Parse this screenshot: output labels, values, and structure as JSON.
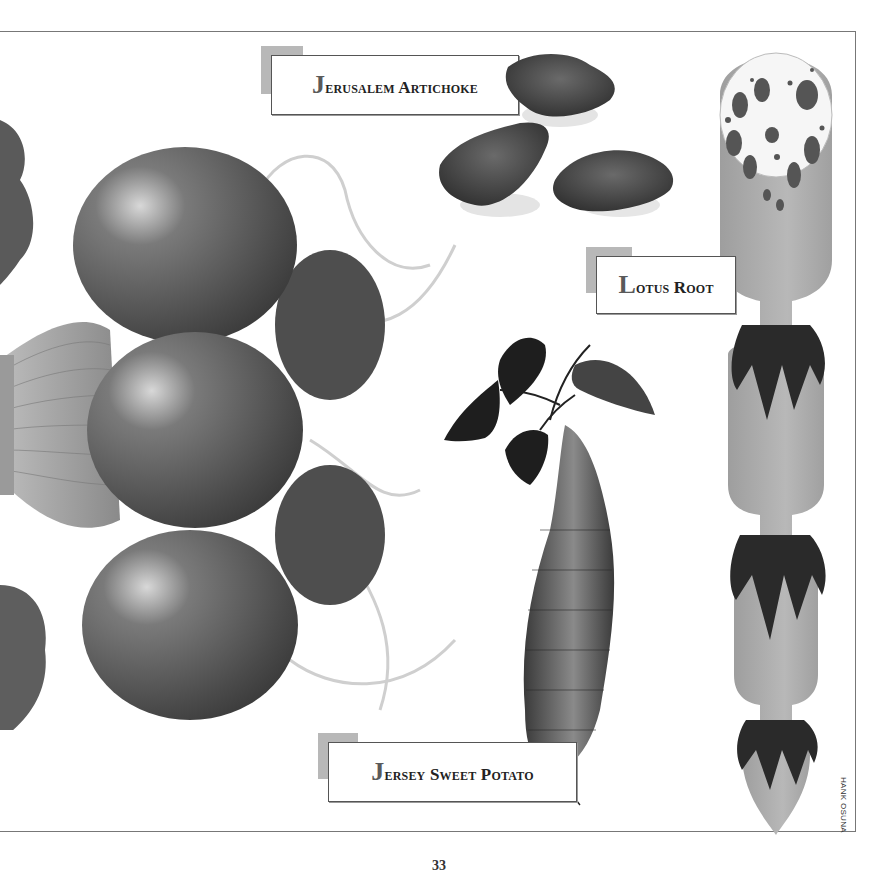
{
  "page": {
    "labels": {
      "jerusalem_artichoke": "Jerusalem Artichoke",
      "lotus_root": "Lotus Root",
      "jersey_sweet_potato": "Jersey Sweet Potato"
    },
    "artist_credit": "HANK OSUNA",
    "page_number": "33"
  },
  "illustrations": [
    {
      "id": "radishes",
      "icon": "radish-bunch-illustration"
    },
    {
      "id": "artichokes",
      "icon": "jerusalem-artichoke-tubers"
    },
    {
      "id": "sweet_potato",
      "icon": "sweet-potato-with-leaves"
    },
    {
      "id": "lotus_root",
      "icon": "lotus-root-segments"
    }
  ],
  "colors": {
    "label_tab": "#b8b8b8",
    "label_border": "#555555",
    "ink": "#222222",
    "lotus_gray": "#a9a9a9"
  }
}
